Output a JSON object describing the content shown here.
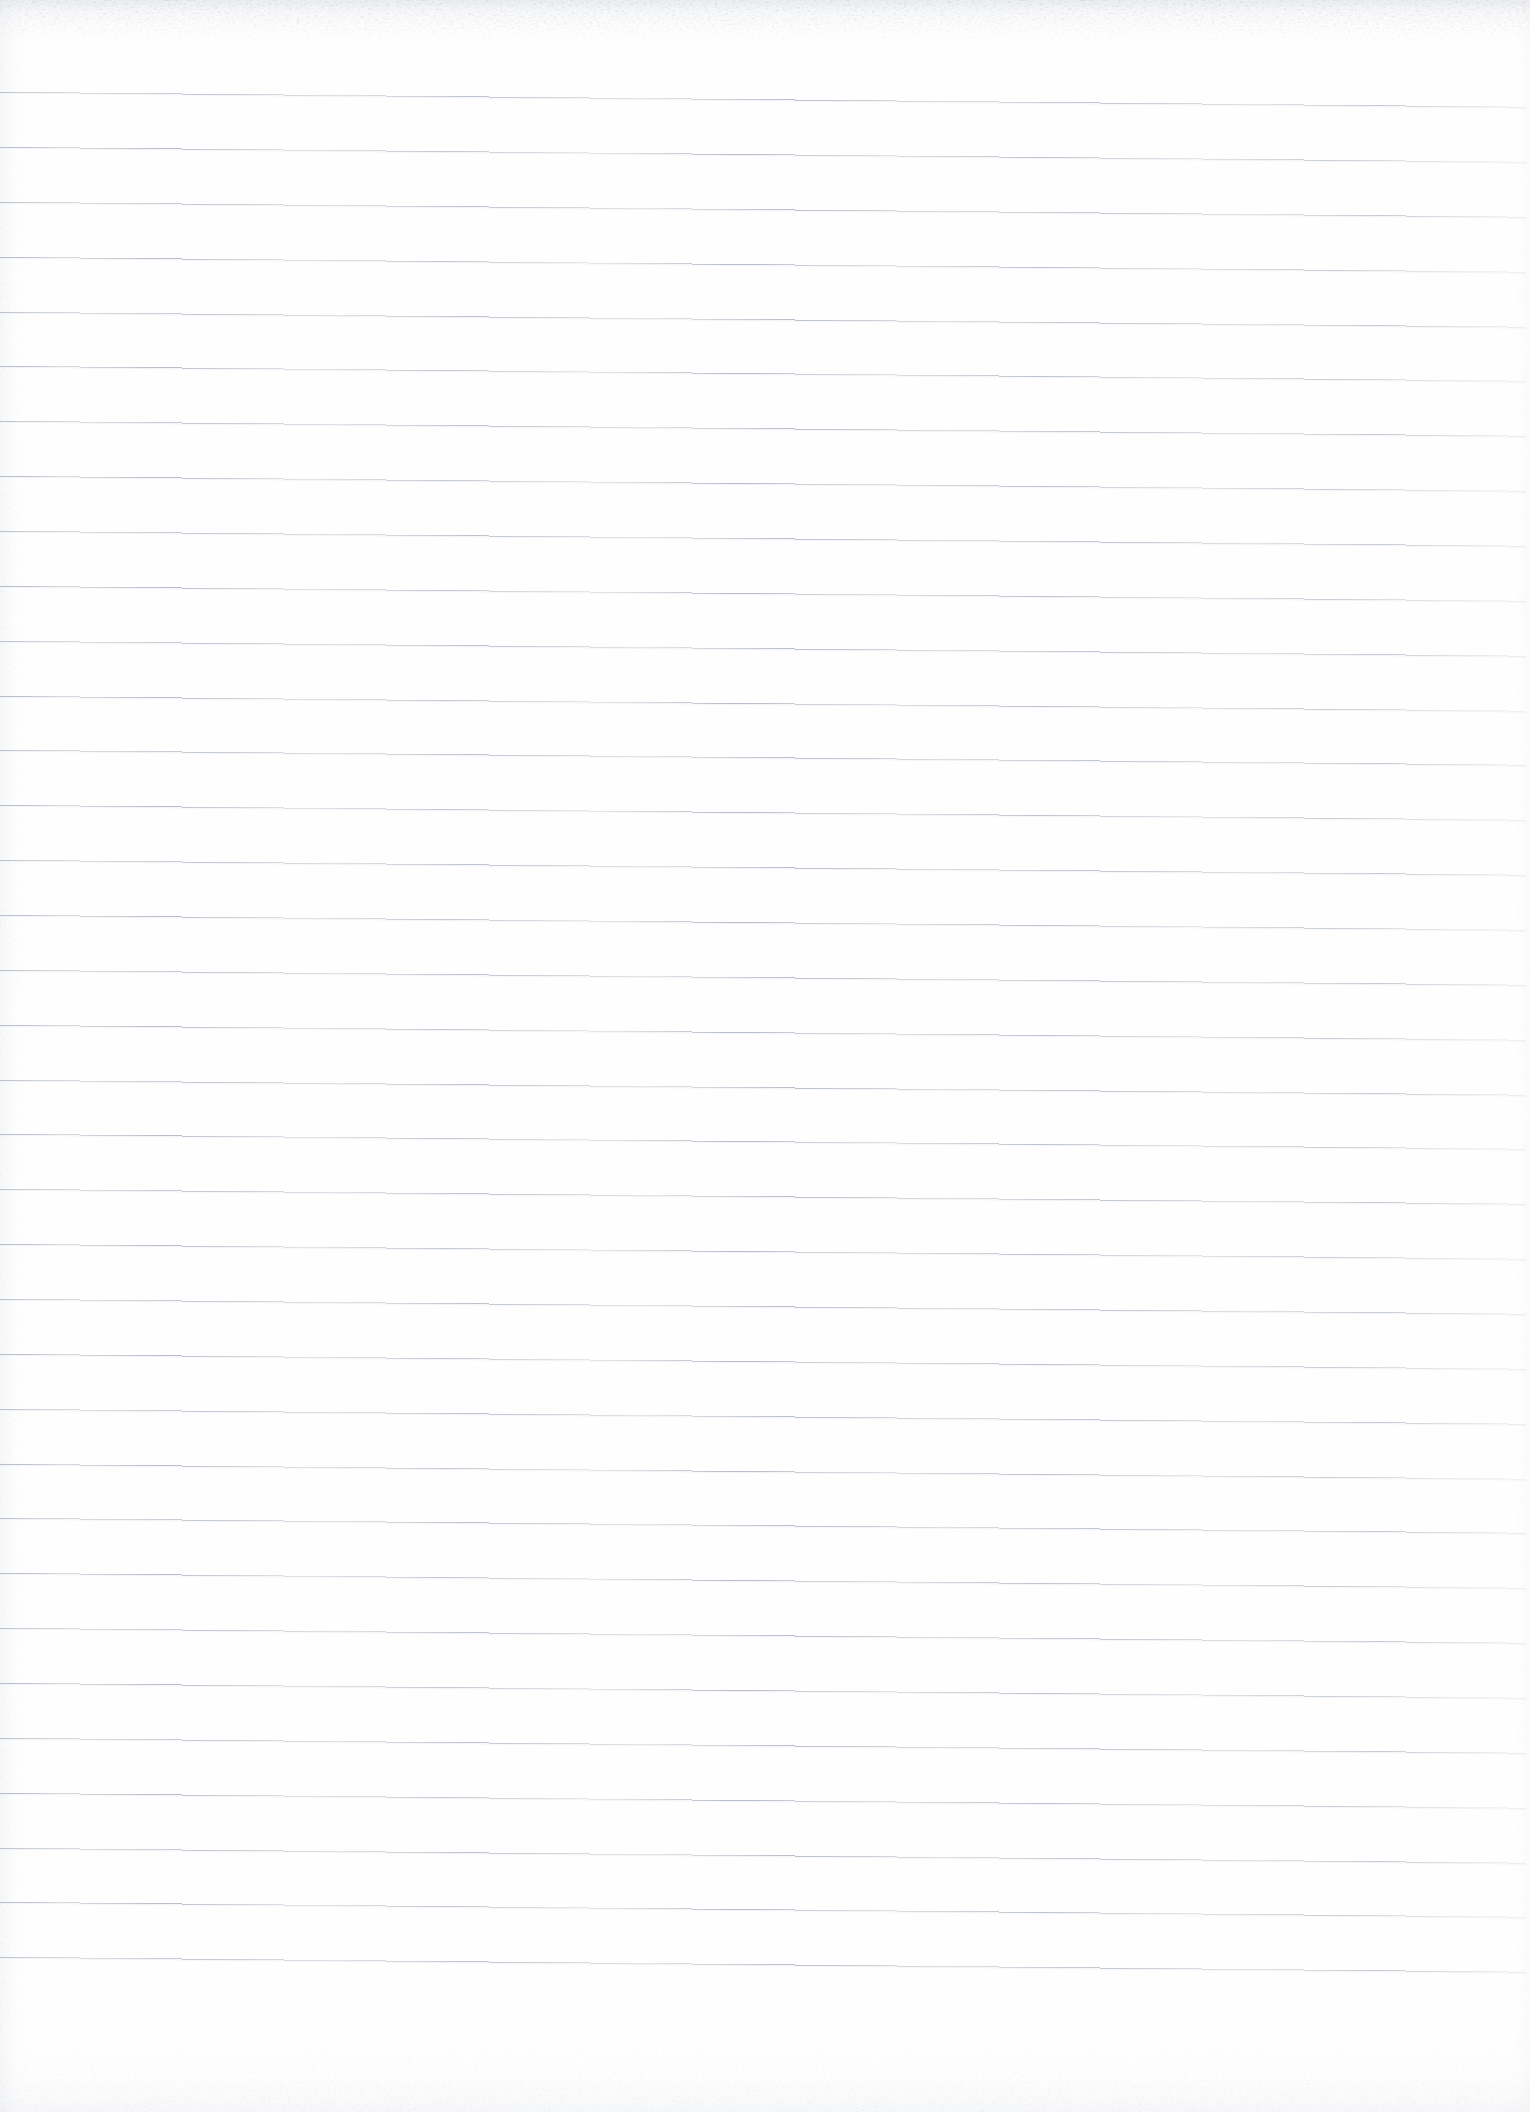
{
  "document": {
    "kind": "scanned-ruled-notebook-page",
    "title": "Blank Lined Paper Scan",
    "page_width": 1530,
    "page_height": 2112,
    "text_content": "",
    "written_content": [],
    "has_handwriting": false,
    "has_printed_text": false,
    "margin_rule": null,
    "header_text": "",
    "footer_text": "",
    "page_number": ""
  },
  "paper": {
    "background_color": "#ffffff",
    "paper_tint_color": "#fdfdfe",
    "edge_shadow_color": "#dfe3e9",
    "grain_color": "#e8ebef",
    "top_edge_style": "torn-perforated",
    "bottom_edge_style": "soft-scan-falloff",
    "left_edge_style": "soft-scan-falloff"
  },
  "ruling": {
    "type": "horizontal-ruled",
    "line_color": "#b9c0cb",
    "line_color_faint": "#d3d9e1",
    "line_thickness_px": 1,
    "line_count": 35,
    "first_line_y": 100,
    "line_spacing_px": 54.9,
    "line_start_x": 0,
    "line_end_x": 1526,
    "skew_degrees": 0.56,
    "skew_direction": "down-to-the-right",
    "line_y_positions": [
      100,
      155,
      210,
      265,
      320,
      374,
      429,
      484,
      539,
      594,
      649,
      704,
      758,
      813,
      868,
      923,
      978,
      1033,
      1088,
      1142,
      1197,
      1252,
      1307,
      1362,
      1417,
      1472,
      1526,
      1581,
      1636,
      1691,
      1746,
      1801,
      1856,
      1910,
      1965
    ]
  }
}
